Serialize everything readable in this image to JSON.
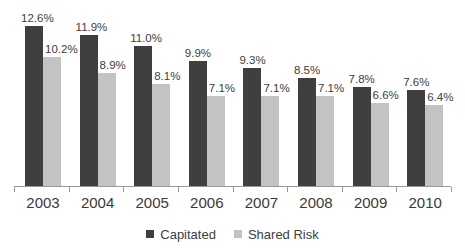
{
  "chart_data": {
    "type": "bar",
    "title": "",
    "xlabel": "",
    "ylabel": "",
    "ylim": [
      0,
      12.6
    ],
    "grid": false,
    "legend_position": "bottom",
    "categories": [
      "2003",
      "2004",
      "2005",
      "2006",
      "2007",
      "2008",
      "2009",
      "2010"
    ],
    "series": [
      {
        "name": "Capitated",
        "color": "#3f3f3f",
        "values": [
          12.6,
          11.9,
          11.0,
          9.9,
          9.3,
          8.5,
          7.8,
          7.6
        ],
        "labels": [
          "12.6%",
          "11.9%",
          "11.0%",
          "9.9%",
          "9.3%",
          "8.5%",
          "7.8%",
          "7.6%"
        ]
      },
      {
        "name": "Shared Risk",
        "color": "#c3c3c3",
        "values": [
          10.2,
          8.9,
          8.1,
          7.1,
          7.1,
          7.1,
          6.6,
          6.4
        ],
        "labels": [
          "10.2%",
          "8.9%",
          "8.1%",
          "7.1%",
          "7.1%",
          "7.1%",
          "6.6%",
          "6.4%"
        ]
      }
    ]
  },
  "legend": {
    "items": [
      {
        "label": "Capitated",
        "color": "#3f3f3f"
      },
      {
        "label": "Shared Risk",
        "color": "#c3c3c3"
      }
    ]
  }
}
